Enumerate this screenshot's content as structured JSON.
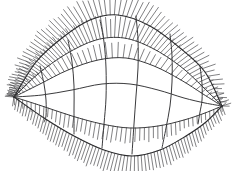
{
  "figure": {
    "kind": "line-drawing",
    "background_color": "#ffffff",
    "ink_color": "#3a3a3c",
    "boundary_color": "#2a2a2c",
    "quill_color": "#4a4a4e",
    "width": 238,
    "height": 171
  },
  "chart_data": {
    "type": "line",
    "subtitle": "",
    "xlabel": "",
    "ylabel": "",
    "grid": false,
    "legend": "none",
    "xlim": [
      0,
      238
    ],
    "ylim": [
      0,
      171
    ],
    "outline": {
      "left_tip": [
        14,
        97
      ],
      "right_tip": [
        222,
        106
      ],
      "top_apex": [
        104,
        14
      ],
      "bottom_apex": [
        133,
        156
      ]
    },
    "u_curves": [
      {
        "name": "u0-top-boundary",
        "quills": "dense-up",
        "points": [
          [
            14,
            97
          ],
          [
            36,
            62
          ],
          [
            62,
            38
          ],
          [
            90,
            20
          ],
          [
            118,
            15
          ],
          [
            150,
            26
          ],
          [
            180,
            48
          ],
          [
            205,
            72
          ],
          [
            222,
            106
          ]
        ]
      },
      {
        "name": "u1",
        "quills": "dense-up",
        "points": [
          [
            14,
            97
          ],
          [
            38,
            74
          ],
          [
            66,
            54
          ],
          [
            96,
            40
          ],
          [
            124,
            38
          ],
          [
            152,
            48
          ],
          [
            180,
            66
          ],
          [
            203,
            87
          ],
          [
            222,
            106
          ]
        ]
      },
      {
        "name": "u2",
        "quills": "medium-up",
        "points": [
          [
            14,
            97
          ],
          [
            40,
            84
          ],
          [
            68,
            70
          ],
          [
            98,
            60
          ],
          [
            126,
            58
          ],
          [
            154,
            66
          ],
          [
            181,
            80
          ],
          [
            203,
            94
          ],
          [
            222,
            106
          ]
        ]
      },
      {
        "name": "u3-middle",
        "quills": "sparse",
        "points": [
          [
            14,
            97
          ],
          [
            42,
            95
          ],
          [
            72,
            90
          ],
          [
            102,
            84
          ],
          [
            130,
            84
          ],
          [
            158,
            90
          ],
          [
            184,
            98
          ],
          [
            205,
            103
          ],
          [
            222,
            106
          ]
        ]
      },
      {
        "name": "u4",
        "quills": "medium-down",
        "points": [
          [
            14,
            97
          ],
          [
            42,
            106
          ],
          [
            72,
            116
          ],
          [
            102,
            124
          ],
          [
            130,
            128
          ],
          [
            158,
            126
          ],
          [
            184,
            120
          ],
          [
            205,
            113
          ],
          [
            222,
            106
          ]
        ]
      },
      {
        "name": "u5-bottom-boundary",
        "quills": "dense-down",
        "points": [
          [
            14,
            97
          ],
          [
            44,
            118
          ],
          [
            74,
            136
          ],
          [
            104,
            150
          ],
          [
            132,
            156
          ],
          [
            160,
            150
          ],
          [
            186,
            136
          ],
          [
            206,
            122
          ],
          [
            222,
            106
          ]
        ]
      }
    ],
    "v_curves": [
      {
        "name": "v1",
        "points": [
          [
            40,
            66
          ],
          [
            44,
            84
          ],
          [
            46,
            100
          ],
          [
            46,
            116
          ],
          [
            44,
            122
          ]
        ]
      },
      {
        "name": "v2",
        "points": [
          [
            68,
            40
          ],
          [
            72,
            62
          ],
          [
            74,
            86
          ],
          [
            74,
            110
          ],
          [
            74,
            134
          ]
        ]
      },
      {
        "name": "v3",
        "points": [
          [
            100,
            20
          ],
          [
            104,
            42
          ],
          [
            106,
            68
          ],
          [
            106,
            98
          ],
          [
            104,
            124
          ],
          [
            102,
            148
          ]
        ]
      },
      {
        "name": "v4",
        "points": [
          [
            136,
            16
          ],
          [
            138,
            40
          ],
          [
            138,
            68
          ],
          [
            136,
            96
          ],
          [
            134,
            124
          ],
          [
            132,
            154
          ]
        ]
      },
      {
        "name": "v5",
        "points": [
          [
            170,
            34
          ],
          [
            172,
            56
          ],
          [
            172,
            82
          ],
          [
            170,
            106
          ],
          [
            166,
            128
          ],
          [
            162,
            148
          ]
        ]
      },
      {
        "name": "v6",
        "points": [
          [
            200,
            66
          ],
          [
            202,
            84
          ],
          [
            202,
            100
          ],
          [
            200,
            112
          ],
          [
            198,
            124
          ]
        ]
      }
    ],
    "normal_field": {
      "glyph": "short-straight-hair",
      "direction_note": "hairs point away from the surface: upward-left on the upper ridge, downward on the lower boundary",
      "dense_regions": [
        "upper-left ridge",
        "top boundary",
        "lower-right boundary",
        "bottom boundary"
      ],
      "typical_length_px": 14,
      "max_length_px": 26
    }
  }
}
